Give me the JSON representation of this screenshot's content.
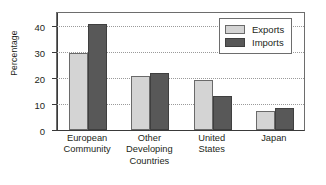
{
  "chart_data": {
    "type": "bar",
    "title": "",
    "xlabel": "",
    "ylabel": "Percentage",
    "ylim": [
      0,
      45
    ],
    "yticks": [
      0,
      10,
      20,
      30,
      40
    ],
    "ytick_labels": [
      "0",
      "10",
      "20",
      "30",
      "40"
    ],
    "grid": true,
    "legend_position": "top-right",
    "categories": [
      "European Community",
      "Other Developing Countries",
      "United States",
      "Japan"
    ],
    "category_lines": [
      [
        "European",
        "Community"
      ],
      [
        "Other",
        "Developing",
        "Countries"
      ],
      [
        "United",
        "States"
      ],
      [
        "Japan"
      ]
    ],
    "series": [
      {
        "name": "Exports",
        "color": "#d4d4d4",
        "values": [
          29.2,
          20.3,
          18.9,
          7.3
        ]
      },
      {
        "name": "Imports",
        "color": "#585858",
        "values": [
          40.0,
          21.4,
          12.7,
          8.2
        ]
      }
    ]
  },
  "legend": {
    "items": [
      {
        "label": "Exports"
      },
      {
        "label": "Imports"
      }
    ]
  },
  "colors": {
    "exports": "#d4d4d4",
    "imports": "#585858",
    "frame": "#6d6d6d",
    "grid": "#9a9a9a",
    "text": "#231f20"
  }
}
